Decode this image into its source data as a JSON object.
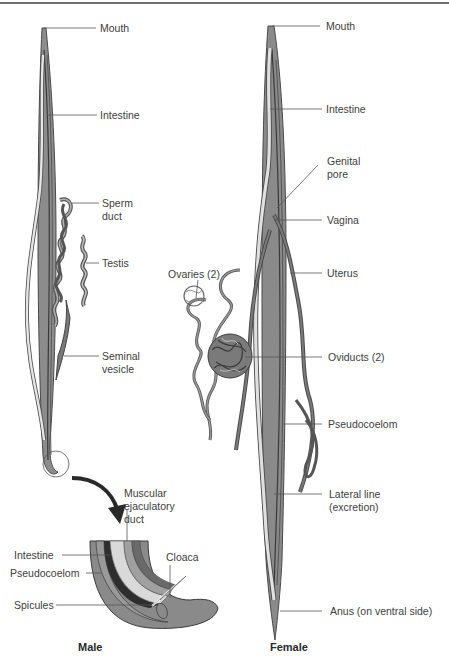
{
  "figure": {
    "colors": {
      "body": "#8c8c8c",
      "body_dark": "#5a5a5a",
      "intestine": "#d8d8d8",
      "outline": "#3c3c3c",
      "pseudocoelom_dark": "#2e2e2e",
      "line": "#555555"
    },
    "male": {
      "caption": "Male",
      "labels": {
        "mouth": "Mouth",
        "intestine": "Intestine",
        "sperm_duct_1": "Sperm",
        "sperm_duct_2": "duct",
        "testis": "Testis",
        "seminal_vesicle_1": "Seminal",
        "seminal_vesicle_2": "vesicle"
      },
      "detail": {
        "muscular_1": "Muscular",
        "muscular_2": "ejaculatory",
        "muscular_3": "duct",
        "intestine": "Intestine",
        "pseudocoelom": "Pseudocoelom",
        "spicules": "Spicules",
        "cloaca": "Cloaca"
      }
    },
    "female": {
      "caption": "Female",
      "labels": {
        "mouth": "Mouth",
        "intestine": "Intestine",
        "genital_pore_1": "Genital",
        "genital_pore_2": "pore",
        "vagina": "Vagina",
        "uterus": "Uterus",
        "ovaries": "Ovaries (2)",
        "oviducts": "Oviducts (2)",
        "pseudocoelom": "Pseudocoelom",
        "lateral_line_1": "Lateral line",
        "lateral_line_2": "(excretion)",
        "anus": "Anus (on ventral side)"
      }
    }
  }
}
